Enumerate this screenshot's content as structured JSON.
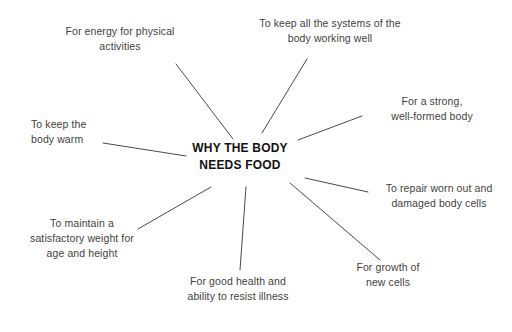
{
  "diagram": {
    "title": "WHY THE BODY\nNEEDS FOOD",
    "center_color": "#121212",
    "label_color": "#3f3f41",
    "line_color": "#4a4a4a",
    "background": "#ffffff",
    "type": "spider-diagram",
    "spoke_count": 8,
    "labels": [
      {
        "id": "energy",
        "text": "For energy for physical\nactivities"
      },
      {
        "id": "systems",
        "text": "To keep all the systems of the\nbody working well"
      },
      {
        "id": "strong",
        "text": "For a strong,\nwell-formed body"
      },
      {
        "id": "repair",
        "text": "To repair worn out and\ndamaged body cells"
      },
      {
        "id": "growth",
        "text": "For growth of\nnew cells"
      },
      {
        "id": "goodhealth",
        "text": "For good health and\nability to resist illness"
      },
      {
        "id": "weight",
        "text": "To maintain a\nsatisfactory weight for\nage and height"
      },
      {
        "id": "warm",
        "text": "To keep the\nbody warm"
      }
    ]
  }
}
